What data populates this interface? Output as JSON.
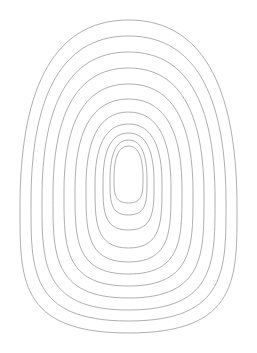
{
  "canvas": {
    "width": 257,
    "height": 353,
    "background_color": "#ffffff",
    "title": "Nested Egg Outline Template"
  },
  "figure": {
    "type": "concentric-egg-outlines",
    "shape_name": "egg",
    "ring_count": 11,
    "stroke_color": "#9a9a9a",
    "stroke_width": 0.8,
    "fill": "none",
    "center_x": 128.5,
    "widest_y": 181
  },
  "chart_data": {
    "type": "scatter",
    "xlabel": "x (px)",
    "ylabel": "y (px)",
    "xlim": [
      0,
      257
    ],
    "ylim": [
      0,
      353
    ],
    "grid": false,
    "legend": "none",
    "note": "Each ring is an egg curve defined by its bounding box: top apex, bottom apex, and half-width at the widest latitude.",
    "columns": [
      "ring",
      "top_y",
      "bottom_y",
      "left_x",
      "right_x",
      "half_width",
      "half_height",
      "widest_y"
    ],
    "rings": [
      {
        "ring": 1,
        "top_y": 20,
        "bottom_y": 333,
        "left_x": 20,
        "right_x": 237,
        "half_width": 108.5,
        "half_height": 156.5,
        "widest_y": 207
      },
      {
        "ring": 2,
        "top_y": 36,
        "bottom_y": 321,
        "left_x": 31,
        "right_x": 226,
        "half_width": 97.5,
        "half_height": 142.5,
        "widest_y": 202
      },
      {
        "ring": 3,
        "top_y": 52,
        "bottom_y": 310,
        "left_x": 42,
        "right_x": 215,
        "half_width": 86.5,
        "half_height": 129.0,
        "widest_y": 198
      },
      {
        "ring": 4,
        "top_y": 68,
        "bottom_y": 298,
        "left_x": 53,
        "right_x": 204,
        "half_width": 75.5,
        "half_height": 115.0,
        "widest_y": 195
      },
      {
        "ring": 5,
        "top_y": 84,
        "bottom_y": 286,
        "left_x": 64,
        "right_x": 193,
        "half_width": 64.5,
        "half_height": 101.0,
        "widest_y": 192
      },
      {
        "ring": 6,
        "top_y": 99,
        "bottom_y": 274,
        "left_x": 75,
        "right_x": 182,
        "half_width": 53.5,
        "half_height": 87.5,
        "widest_y": 189
      },
      {
        "ring": 7,
        "top_y": 112,
        "bottom_y": 262,
        "left_x": 86,
        "right_x": 171,
        "half_width": 42.5,
        "half_height": 75.0,
        "widest_y": 187
      },
      {
        "ring": 8,
        "top_y": 124,
        "bottom_y": 248,
        "left_x": 95,
        "right_x": 162,
        "half_width": 33.5,
        "half_height": 62.0,
        "widest_y": 184
      },
      {
        "ring": 9,
        "top_y": 133,
        "bottom_y": 230,
        "left_x": 103,
        "right_x": 154,
        "half_width": 25.5,
        "half_height": 48.5,
        "widest_y": 182
      },
      {
        "ring": 10,
        "top_y": 140,
        "bottom_y": 215,
        "left_x": 110,
        "right_x": 147,
        "half_width": 18.5,
        "half_height": 37.5,
        "widest_y": 180
      },
      {
        "ring": 11,
        "top_y": 146,
        "bottom_y": 203,
        "left_x": 114,
        "right_x": 143,
        "half_width": 14.5,
        "half_height": 28.5,
        "widest_y": 178
      }
    ]
  }
}
